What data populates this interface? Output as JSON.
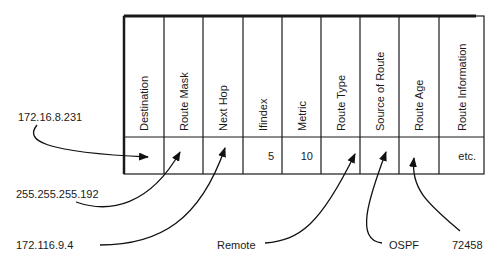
{
  "diagram": {
    "columns": [
      {
        "header": "Destination",
        "value": ""
      },
      {
        "header": "Route Mask",
        "value": ""
      },
      {
        "header": "Next Hop",
        "value": ""
      },
      {
        "header": "Ifindex",
        "value": "5"
      },
      {
        "header": "Metric",
        "value": "10"
      },
      {
        "header": "Route Type",
        "value": ""
      },
      {
        "header": "Source of Route",
        "value": ""
      },
      {
        "header": "Route Age",
        "value": ""
      },
      {
        "header": "Route Information",
        "value": "etc."
      }
    ],
    "callouts": [
      {
        "label": "172.16.8.231",
        "target_column": "Destination"
      },
      {
        "label": "255.255.255.192",
        "target_column": "Route Mask"
      },
      {
        "label": "172.116.9.4",
        "target_column": "Next Hop"
      },
      {
        "label": "Remote",
        "target_column": "Route Type"
      },
      {
        "label": "OSPF",
        "target_column": "Source of Route"
      },
      {
        "label": "72458",
        "target_column": "Route Age"
      }
    ]
  }
}
